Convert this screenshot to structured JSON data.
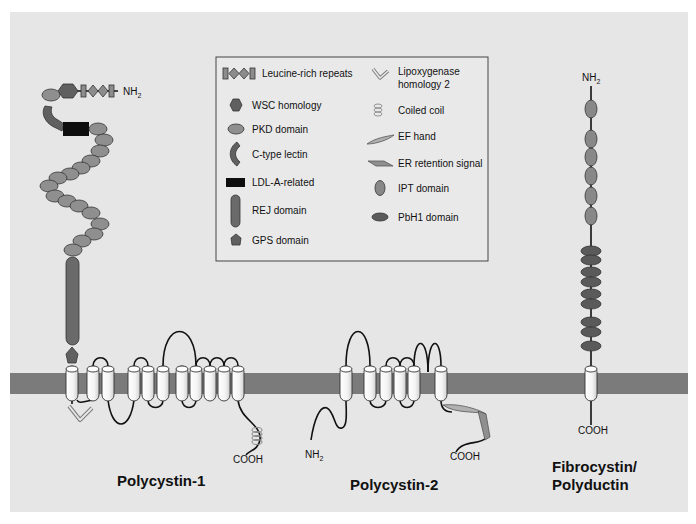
{
  "diagram": {
    "type": "membrane protein domain topology",
    "background_color": "#e6e6e6",
    "membrane_color": "#7b7b7b",
    "proteins": [
      {
        "id": "pc1",
        "name": "Polycystin-1",
        "n_terminus": "NH2",
        "c_terminus": "COOH",
        "n_terminus_location": "extracellular",
        "transmembrane_segments": 11,
        "extracellular_domains_from_N": [
          "Leucine-rich repeats",
          "WSC homology",
          "PKD domain",
          "C-type lectin",
          "LDL-A-related",
          "PKD domain x15",
          "REJ domain",
          "GPS domain"
        ],
        "intracellular_domains": [
          "Lipoxygenase homology 2",
          "Coiled coil"
        ]
      },
      {
        "id": "pc2",
        "name": "Polycystin-2",
        "n_terminus": "NH2",
        "c_terminus": "COOH",
        "n_terminus_location": "intracellular",
        "transmembrane_segments": 6,
        "intracellular_domains": [
          "EF hand",
          "ER retention signal"
        ]
      },
      {
        "id": "fpc",
        "name_line1": "Fibrocystin/",
        "name_line2": "Polyductin",
        "n_terminus": "NH2",
        "c_terminus": "COOH",
        "n_terminus_location": "extracellular",
        "transmembrane_segments": 1,
        "extracellular_domains": [
          "IPT domain x6",
          "PbH1 domain x9"
        ]
      }
    ]
  },
  "legend": {
    "left": [
      {
        "icon": "leucine-rich-repeats-icon",
        "label": "Leucine-rich repeats"
      },
      {
        "icon": "wsc-homology-icon",
        "label": "WSC homology"
      },
      {
        "icon": "pkd-domain-icon",
        "label": "PKD domain"
      },
      {
        "icon": "c-type-lectin-icon",
        "label": "C-type lectin"
      },
      {
        "icon": "ldl-a-related-icon",
        "label": "LDL-A-related"
      },
      {
        "icon": "rej-domain-icon",
        "label": "REJ domain"
      },
      {
        "icon": "gps-domain-icon",
        "label": "GPS domain"
      }
    ],
    "right": [
      {
        "icon": "lipoxygenase-icon",
        "label_line1": "Lipoxygenase",
        "label_line2": "homology 2"
      },
      {
        "icon": "coiled-coil-icon",
        "label": "Coiled coil"
      },
      {
        "icon": "ef-hand-icon",
        "label": "EF hand"
      },
      {
        "icon": "er-retention-icon",
        "label": "ER retention signal"
      },
      {
        "icon": "ipt-domain-icon",
        "label": "IPT domain"
      },
      {
        "icon": "pbh1-domain-icon",
        "label": "PbH1 domain"
      }
    ]
  },
  "labels": {
    "pc1_title": "Polycystin-1",
    "pc2_title": "Polycystin-2",
    "fpc_title_line1": "Fibrocystin/",
    "fpc_title_line2": "Polyductin",
    "pc1_nh2": "NH",
    "pc1_nh2_sub": "2",
    "pc1_cooh": "COOH",
    "pc2_nh2": "NH",
    "pc2_nh2_sub": "2",
    "pc2_cooh": "COOH",
    "fpc_nh2": "NH",
    "fpc_nh2_sub": "2",
    "fpc_cooh": "COOH"
  }
}
